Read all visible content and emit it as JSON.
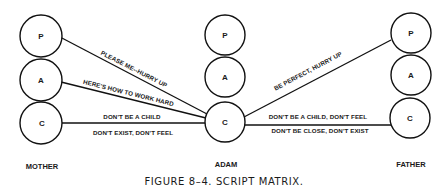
{
  "diagram": {
    "people": [
      {
        "name": "MOTHER",
        "ego_states": [
          "P",
          "A",
          "C"
        ]
      },
      {
        "name": "ADAM",
        "ego_states": [
          "P",
          "A",
          "C"
        ]
      },
      {
        "name": "FATHER",
        "ego_states": [
          "P",
          "A",
          "C"
        ]
      }
    ],
    "messages": {
      "mother_p_to_adam_c": "PLEASE ME--HURRY UP",
      "mother_a_to_adam_c": "HERE'S HOW TO WORK HARD",
      "mother_c_to_adam_c_top": "DON'T BE A CHILD",
      "mother_c_to_adam_c_bottom": "DON'T EXIST, DON'T FEEL",
      "father_p_to_adam_c": "BE PERFECT, HURRY UP",
      "father_c_to_adam_c_top": "DON'T BE A CHILD, DON'T FEEL",
      "father_c_to_adam_c_bottom": "DON'T BE CLOSE,  DON'T EXIST"
    },
    "caption": "FIGURE 8–4. SCRIPT MATRIX."
  }
}
